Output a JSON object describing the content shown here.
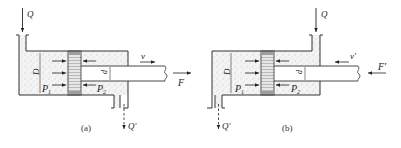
{
  "diagram": {
    "type": "hydraulic-cylinder-comparison",
    "colors": {
      "line": "#333333",
      "fluid": "#f2f2f2",
      "piston": "#cfcfcf",
      "dots": "#9a9a9a"
    },
    "panels": [
      {
        "id": "a",
        "caption": "(a)",
        "inlet_label": "Q",
        "outlet_label": "Q'",
        "diameter_label": "D",
        "rod_diameter_label": "d",
        "pressure_left_label": "P1",
        "pressure_left_sub": "1",
        "pressure_right_label": "P2",
        "pressure_right_sub": "2",
        "velocity_label": "v",
        "force_label": "F",
        "motion_direction": "right"
      },
      {
        "id": "b",
        "caption": "(b)",
        "inlet_label": "Q",
        "outlet_label": "Q'",
        "diameter_label": "D",
        "rod_diameter_label": "d",
        "pressure_left_label": "P1",
        "pressure_left_sub": "1",
        "pressure_right_label": "P2",
        "pressure_right_sub": "2",
        "velocity_label": "v'",
        "force_label": "F'",
        "motion_direction": "left"
      }
    ]
  }
}
